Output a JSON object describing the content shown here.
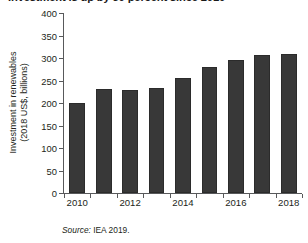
{
  "chart_data": {
    "type": "bar",
    "title": "Investment is up by 50 percent since 2010",
    "xlabel": "",
    "ylabel": "Investment in renewables (2018 US$, billions)",
    "ylabel_line1": "Investment in renewables",
    "ylabel_line2": "(2018 US$, billions)",
    "categories": [
      "2010",
      "2011",
      "2012",
      "2013",
      "2014",
      "2015",
      "2016",
      "2017",
      "2018"
    ],
    "values": [
      200,
      231,
      230,
      234,
      255,
      281,
      295,
      306,
      308
    ],
    "ylim": [
      0,
      400
    ],
    "ytick_values": [
      0,
      50,
      100,
      150,
      200,
      250,
      300,
      350,
      400
    ],
    "ytick_labels": [
      "0",
      "50",
      "100",
      "150",
      "200",
      "250",
      "300",
      "350",
      "400"
    ],
    "xtick_labels_visible": [
      "2010",
      "2012",
      "2014",
      "2016",
      "2018"
    ],
    "xtick_indices_visible": [
      0,
      2,
      4,
      6,
      8
    ],
    "grid": false,
    "legend": "none",
    "bar_color": "#383838",
    "axis_color": "#58595b"
  },
  "source": {
    "keyword": "Source:",
    "text": "IEA 2019."
  }
}
